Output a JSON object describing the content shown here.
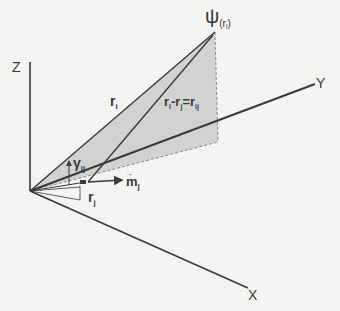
{
  "diagram": {
    "type": "3d-vector-geometry",
    "axes": {
      "z": {
        "label": "Z"
      },
      "y": {
        "label": "Y"
      },
      "x": {
        "label": "X"
      }
    },
    "point": {
      "symbol": "ψ",
      "subscript": "(r",
      "subscript_index": "i",
      "subscript_close": ")"
    },
    "vectors": {
      "r_i": {
        "base": "r",
        "sub": "i"
      },
      "r_j": {
        "base": "r",
        "sub": "j"
      },
      "r_ij": {
        "lhs_a": "r",
        "lhs_a_sub": "i",
        "minus": "-",
        "lhs_b": "r",
        "lhs_b_sub": "j",
        "eq": "=",
        "rhs": "r",
        "rhs_sub": "ij"
      },
      "m_j": {
        "base": "m",
        "accent": "→",
        "sub": "j"
      }
    },
    "angle": {
      "symbol": "γ",
      "sub": "ij"
    },
    "colors": {
      "background": "#f4f4f2",
      "line": "#3a3a3a",
      "plane_fill": "#d2d2d0",
      "dashed": "#8a8a8a"
    }
  }
}
